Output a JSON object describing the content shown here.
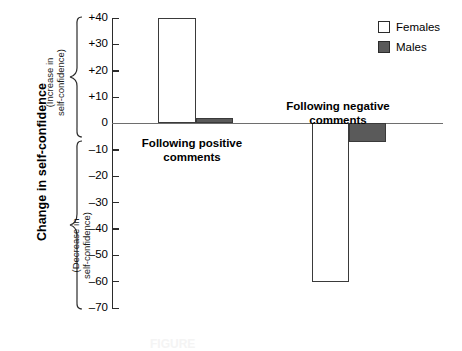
{
  "chart_data": {
    "type": "bar",
    "title": "",
    "xlabel": "",
    "ylabel": "Change in self-confidence",
    "ylim": [
      -70,
      40
    ],
    "ytick_step": 10,
    "grid": false,
    "legend_position": "top-right",
    "categories": [
      "Following positive comments",
      "Following negative comments"
    ],
    "series": [
      {
        "name": "Females",
        "values": [
          40,
          -60
        ],
        "color": "#ffffff"
      },
      {
        "name": "Males",
        "values": [
          2,
          -7
        ],
        "color": "#5a5a5a"
      }
    ],
    "y_tick_labels": [
      "+40",
      "+30",
      "+20",
      "+10",
      "0",
      "–10",
      "–20",
      "–30",
      "–40",
      "–50",
      "–60",
      "–70"
    ],
    "y_tick_values": [
      40,
      30,
      20,
      10,
      0,
      -10,
      -20,
      -30,
      -40,
      -50,
      -60,
      -70
    ],
    "axis_annotations": [
      "(Increase in self-confidence)",
      "(Decrease in self-confidence)"
    ]
  },
  "axis": {
    "y_title": "Change in self-confidence",
    "increase_label": "(Increase in\nself-confidence)",
    "increase_label_line1": "(Increase in",
    "increase_label_line2": "self-confidence)",
    "decrease_label_line1": "(Decrease in",
    "decrease_label_line2": "self-confidence)"
  },
  "groups": [
    {
      "label_line1": "Following positive",
      "label_line2": "comments"
    },
    {
      "label_line1": "Following negative",
      "label_line2": "comments"
    }
  ],
  "legend": {
    "items": [
      {
        "label": "Females",
        "swatch": "open-square-swatch"
      },
      {
        "label": "Males",
        "swatch": "filled-square-swatch"
      }
    ]
  },
  "caption": {
    "text": "FIGURE"
  },
  "colors": {
    "female_fill": "#ffffff",
    "male_fill": "#5a5a5a",
    "bar_stroke": "#3a3a3a",
    "axis": "#2b2b2b",
    "zero_line": "#6e6e6e"
  }
}
